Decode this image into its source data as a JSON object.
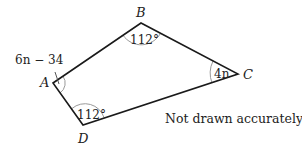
{
  "diagram": {
    "type": "quadrilateral",
    "vertices": {
      "A": {
        "label": "A",
        "x": 53,
        "y": 83
      },
      "B": {
        "label": "B",
        "x": 141,
        "y": 23
      },
      "C": {
        "label": "C",
        "x": 238,
        "y": 74
      },
      "D": {
        "label": "D",
        "x": 83,
        "y": 125
      }
    },
    "angles": {
      "A": "6n − 34",
      "B": "112°",
      "C": "4n",
      "D": "112°"
    },
    "note": "Not drawn accurately",
    "colors": {
      "edge": "#1a1a1a",
      "arc": "#9a9a9a",
      "text": "#222222",
      "background": "#ffffff"
    }
  }
}
